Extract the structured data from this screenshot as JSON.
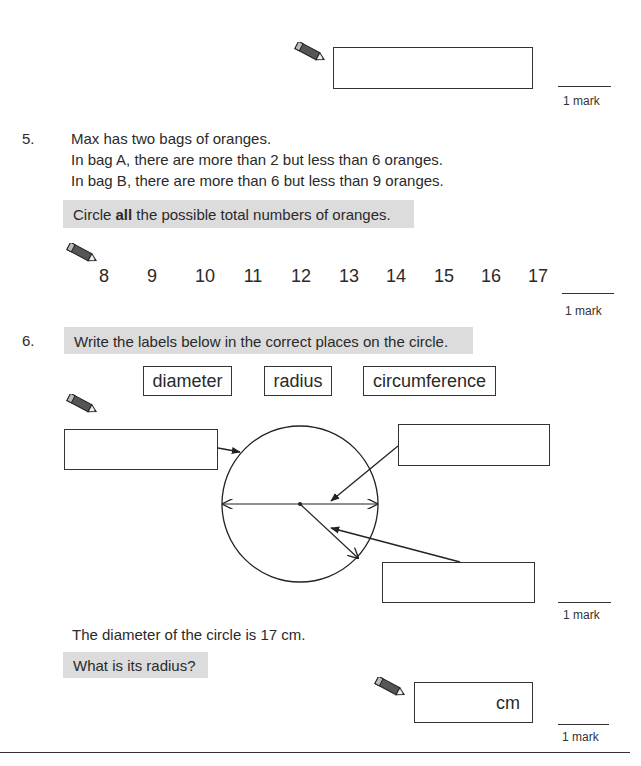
{
  "previous_question": {
    "answer_box": "",
    "mark": "1 mark"
  },
  "question5": {
    "number": "5.",
    "lines": [
      "Max has two bags of oranges.",
      "In bag A, there are more than 2 but less than 6 oranges.",
      "In bag B, there are more than 6 but less than 9 oranges."
    ],
    "instruction": {
      "before": "Circle ",
      "bold": "all",
      "after": " the possible total numbers of oranges."
    },
    "options": [
      "8",
      "9",
      "10",
      "11",
      "12",
      "13",
      "14",
      "15",
      "16",
      "17"
    ],
    "mark": "1 mark"
  },
  "question6": {
    "number": "6.",
    "instruction": "Write the labels below in the correct places on the circle.",
    "labels": [
      "diameter",
      "radius",
      "circumference"
    ],
    "answer_boxes": [
      "",
      "",
      ""
    ],
    "mark": "1 mark",
    "part_b": {
      "statement": "The diameter of the circle is 17 cm.",
      "question": "What is its radius?",
      "answer_value": "",
      "unit": "cm",
      "mark": "1 mark"
    }
  },
  "icons": {
    "pencil": "pencil-icon"
  },
  "colors": {
    "highlight_band": "#dcdcdc",
    "ink": "#2a2a2a"
  }
}
